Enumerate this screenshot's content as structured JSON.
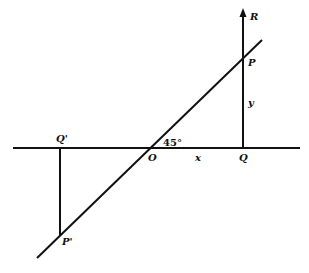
{
  "diagram": {
    "type": "geometric-reflection",
    "angle_label": "45°",
    "labels": {
      "R": "R",
      "P": "P",
      "y": "y",
      "Q_prime": "Q'",
      "O": "O",
      "x": "x",
      "Q": "Q",
      "P_prime": "P'"
    },
    "colors": {
      "stroke": "#111111",
      "background": "#ffffff"
    }
  }
}
